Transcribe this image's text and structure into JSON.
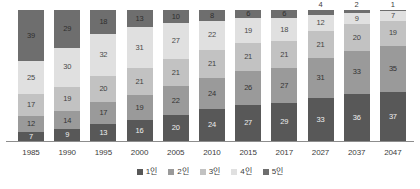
{
  "chart_data": {
    "type": "bar",
    "stacked": true,
    "stack_mode": "percent",
    "title": "",
    "subtitle": "",
    "xlabel": "",
    "ylabel": "",
    "ylim": [
      0,
      100
    ],
    "grid": false,
    "legend_position": "bottom",
    "categories": [
      "1985",
      "1990",
      "1995",
      "2000",
      "2005",
      "2010",
      "2015",
      "2017",
      "2027",
      "2037",
      "2047"
    ],
    "series": [
      {
        "name": "1인",
        "color": "#585858",
        "values": [
          7,
          9,
          13,
          16,
          20,
          24,
          27,
          29,
          33,
          36,
          37
        ]
      },
      {
        "name": "2인",
        "color": "#9a9a9a",
        "values": [
          12,
          14,
          17,
          19,
          22,
          24,
          26,
          27,
          31,
          33,
          35
        ]
      },
      {
        "name": "3인",
        "color": "#c2c2c2",
        "values": [
          17,
          19,
          20,
          21,
          21,
          21,
          21,
          21,
          21,
          20,
          19
        ]
      },
      {
        "name": "4인",
        "color": "#e0e0e0",
        "values": [
          25,
          30,
          32,
          31,
          27,
          22,
          19,
          18,
          12,
          9,
          7
        ]
      },
      {
        "name": "5인",
        "color": "#6e6e6e",
        "values": [
          39,
          29,
          18,
          13,
          10,
          8,
          6,
          6,
          4,
          2,
          1
        ]
      }
    ],
    "outside_labels": {
      "2027": "4",
      "2037": "2",
      "2047": "1"
    }
  },
  "legend": {
    "items": [
      {
        "label": "1인",
        "color": "#585858"
      },
      {
        "label": "2인",
        "color": "#9a9a9a"
      },
      {
        "label": "3인",
        "color": "#c2c2c2"
      },
      {
        "label": "4인",
        "color": "#e0e0e0"
      },
      {
        "label": "5인",
        "color": "#6e6e6e"
      }
    ]
  }
}
